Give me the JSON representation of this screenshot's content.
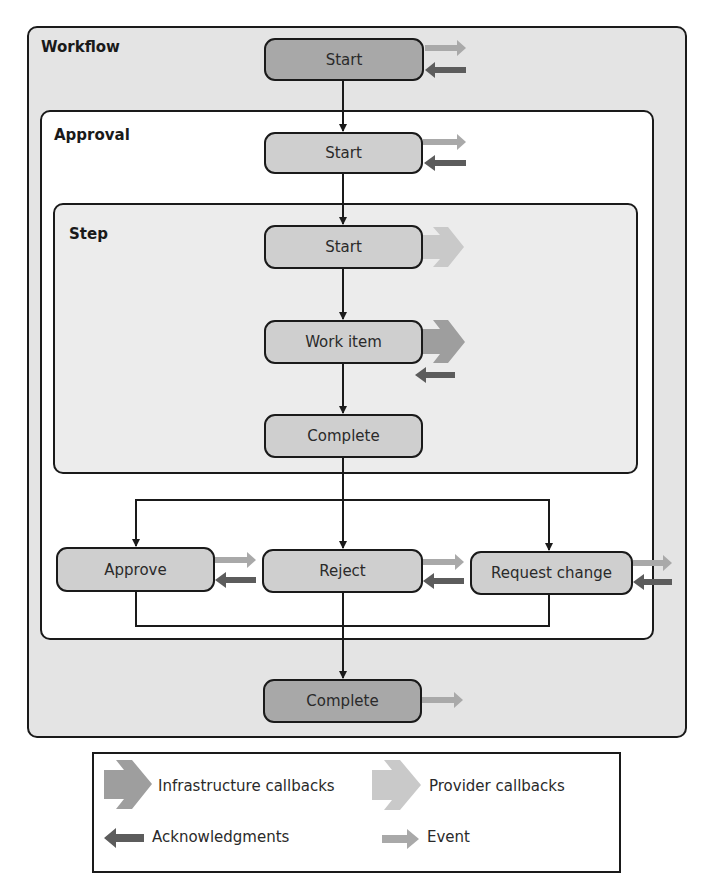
{
  "containers": {
    "workflow": "Workflow",
    "approval": "Approval",
    "step": "Step"
  },
  "nodes": {
    "workflow_start": "Start",
    "approval_start": "Start",
    "step_start": "Start",
    "work_item": "Work item",
    "step_complete": "Complete",
    "approve": "Approve",
    "reject": "Reject",
    "request_change": "Request change",
    "workflow_complete": "Complete"
  },
  "legend": {
    "infrastructure_callbacks": "Infrastructure callbacks",
    "provider_callbacks": "Provider callbacks",
    "acknowledgments": "Acknowledgments",
    "event": "Event"
  },
  "colors": {
    "event": "#a9a9a9",
    "acknowledgment": "#5c5c5c",
    "infrastructure_callback": "#9e9e9e",
    "provider_callback": "#c4c4c4",
    "dark_node": "#a8a8a8",
    "light_node": "#cfcfcf"
  }
}
